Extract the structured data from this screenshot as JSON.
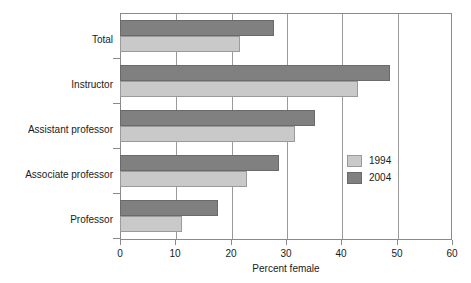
{
  "chart_data": {
    "type": "bar",
    "orientation": "horizontal",
    "title": "",
    "xlabel": "Percent female",
    "ylabel": "",
    "xlim": [
      0,
      60
    ],
    "ylim": null,
    "xticks": [
      0,
      10,
      20,
      30,
      40,
      50,
      60
    ],
    "xtick_labels": [
      "0",
      "10",
      "20",
      "30",
      "40",
      "50",
      "60"
    ],
    "grid": "vertical",
    "legend_position": "center-right",
    "categories": [
      "Total",
      "Instructor",
      "Assistant professor",
      "Associate professor",
      "Professor"
    ],
    "series": [
      {
        "name": "1994",
        "color": "#c9c9c9",
        "values": [
          21.7,
          43.0,
          31.7,
          23.0,
          11.2
        ]
      },
      {
        "name": "2004",
        "color": "#808080",
        "values": [
          27.8,
          48.8,
          35.2,
          28.7,
          17.7
        ]
      }
    ]
  },
  "legend": {
    "entries": [
      {
        "label": "1994",
        "color": "#c9c9c9"
      },
      {
        "label": "2004",
        "color": "#808080"
      }
    ]
  },
  "axis": {
    "x_title": "Percent female"
  }
}
